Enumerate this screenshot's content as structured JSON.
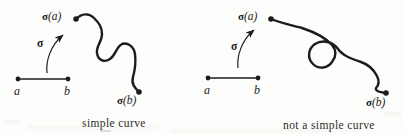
{
  "colors": {
    "background": "#fdfdfb",
    "ink": "#1c1c1c"
  },
  "panels": {
    "left": {
      "caption": "simple curve",
      "map_label": "σ",
      "start_label_bold": "σ",
      "start_label_arg": "(a)",
      "end_label_bold": "σ",
      "end_label_arg": "(b)",
      "segment_a": "a",
      "segment_b": "b"
    },
    "right": {
      "caption": "not a simple curve",
      "map_label": "σ",
      "start_label_bold": "σ",
      "start_label_arg": "(a)",
      "end_label_bold": "σ",
      "end_label_arg": "(b)",
      "segment_a": "a",
      "segment_b": "b"
    }
  }
}
